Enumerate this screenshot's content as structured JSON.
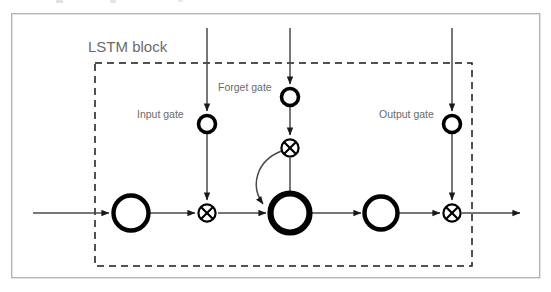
{
  "figure": {
    "kind": "diagram",
    "subject": "LSTM block",
    "background_color": "#ffffff",
    "frame": {
      "name": "outer-figure-border",
      "x": 11,
      "y": 13,
      "width": 529,
      "height": 265,
      "stroke_color": "#b5b5b5",
      "stroke_width": 1.4
    },
    "block_boundary": {
      "name": "lstm-block-dashed-boundary",
      "x": 95,
      "y": 63,
      "width": 377,
      "height": 203,
      "stroke_color": "#1a1a1a",
      "stroke_width": 1.5,
      "dash_pattern": "7 5"
    }
  },
  "labels": {
    "block_title": "LSTM block",
    "input_gate": "Input gate",
    "forget_gate": "Forget gate",
    "output_gate": "Output gate",
    "text_color": "#6b6b6b"
  },
  "nodes": [
    {
      "id": "input-squash-node",
      "name": "input-squashing-circle",
      "role": "input squashing function g",
      "shape": "circle-open",
      "cx": 131,
      "cy": 213,
      "r": 18,
      "stroke_width": 4.2,
      "stroke_color": "#000000"
    },
    {
      "id": "input-gate-node",
      "name": "input-gate-circle",
      "role": "input gate unit",
      "shape": "circle-open",
      "cx": 207,
      "cy": 124,
      "r": 9,
      "stroke_width": 3.4,
      "stroke_color": "#000000"
    },
    {
      "id": "input-multiply-node",
      "name": "input-multiply-operator",
      "role": "multiplicative input gating",
      "shape": "circle-cross",
      "cx": 207,
      "cy": 213,
      "r": 9,
      "stroke_width": 2.2,
      "stroke_color": "#000000"
    },
    {
      "id": "forget-gate-node",
      "name": "forget-gate-circle",
      "role": "forget gate unit",
      "shape": "circle-open",
      "cx": 290,
      "cy": 97,
      "r": 9,
      "stroke_width": 3.4,
      "stroke_color": "#000000"
    },
    {
      "id": "forget-multiply-node",
      "name": "forget-multiply-operator",
      "role": "multiplicative forget gating on recurrent self-connection",
      "shape": "circle-cross",
      "cx": 290,
      "cy": 148,
      "r": 9,
      "stroke_width": 2.2,
      "stroke_color": "#000000"
    },
    {
      "id": "cell-state-node",
      "name": "memory-cell-circle",
      "role": "constant error carousel / memory cell state",
      "shape": "circle-open",
      "cx": 290,
      "cy": 213,
      "r": 20,
      "stroke_width": 6,
      "stroke_color": "#000000"
    },
    {
      "id": "output-squash-node",
      "name": "output-squashing-circle",
      "role": "output squashing function h",
      "shape": "circle-open",
      "cx": 381,
      "cy": 213,
      "r": 17,
      "stroke_width": 4.2,
      "stroke_color": "#000000"
    },
    {
      "id": "output-gate-node",
      "name": "output-gate-circle",
      "role": "output gate unit",
      "shape": "circle-open",
      "cx": 452,
      "cy": 124,
      "r": 9,
      "stroke_width": 3.4,
      "stroke_color": "#000000"
    },
    {
      "id": "output-multiply-node",
      "name": "output-multiply-operator",
      "role": "multiplicative output gating",
      "shape": "circle-cross",
      "cx": 452,
      "cy": 213,
      "r": 9,
      "stroke_width": 2.2,
      "stroke_color": "#000000"
    }
  ],
  "connections": [
    {
      "id": "net-input-arrow",
      "name": "net-input-flow-arrow",
      "description": "net input entering the input squashing unit",
      "kind": "horizontal-arrow",
      "from_x": 33,
      "to_x": 110,
      "y": 213,
      "arrowhead": true
    },
    {
      "id": "squash-to-multiply",
      "name": "squash-to-input-multiply-arrow",
      "description": "squashed input toward multiplicative input gate",
      "kind": "horizontal-arrow",
      "from_x": 151,
      "to_x": 196,
      "y": 213,
      "arrowhead": true
    },
    {
      "id": "multiply-to-cell",
      "name": "input-multiply-to-cell-arrow",
      "description": "gated input entering the memory cell",
      "kind": "horizontal-arrow",
      "from_x": 218,
      "to_x": 267,
      "y": 213,
      "arrowhead": true
    },
    {
      "id": "cell-to-output-squash",
      "name": "cell-to-output-squash-arrow",
      "description": "cell state toward output squashing function",
      "kind": "horizontal-arrow",
      "from_x": 311,
      "to_x": 362,
      "y": 213,
      "arrowhead": true
    },
    {
      "id": "output-squash-to-multiply",
      "name": "output-squash-to-output-multiply-arrow",
      "description": "squashed cell output toward multiplicative output gate",
      "kind": "horizontal-arrow",
      "from_x": 399,
      "to_x": 441,
      "y": 213,
      "arrowhead": true
    },
    {
      "id": "block-output-arrow",
      "name": "block-output-flow-arrow",
      "description": "block output leaving the LSTM block",
      "kind": "horizontal-arrow",
      "from_x": 462,
      "to_x": 521,
      "y": 213,
      "arrowhead": true
    },
    {
      "id": "input-gate-incoming",
      "name": "input-gate-incoming-arrow",
      "description": "external activation entering the input gate unit",
      "kind": "vertical-arrow",
      "x": 207,
      "from_y": 28,
      "to_y": 113,
      "arrowhead": true
    },
    {
      "id": "input-gate-to-multiply",
      "name": "input-gate-to-multiply-arrow",
      "description": "input gate activation controlling the input multiplier",
      "kind": "vertical-arrow",
      "x": 207,
      "from_y": 133,
      "to_y": 202,
      "arrowhead": true
    },
    {
      "id": "forget-gate-incoming",
      "name": "forget-gate-incoming-arrow",
      "description": "external activation entering the forget gate unit",
      "kind": "vertical-arrow",
      "x": 290,
      "from_y": 28,
      "to_y": 86,
      "arrowhead": true
    },
    {
      "id": "forget-gate-to-multiply",
      "name": "forget-gate-to-multiply-arrow",
      "description": "forget gate activation controlling the recurrent multiplier",
      "kind": "vertical-arrow",
      "x": 290,
      "from_y": 106,
      "to_y": 137,
      "arrowhead": true
    },
    {
      "id": "forget-multiply-to-cell",
      "name": "forget-multiply-to-cell-arrow",
      "description": "gated recurrent self-connection feeding back into the cell",
      "kind": "vertical-arrow",
      "x": 290,
      "from_y": 159,
      "to_y": 192,
      "arrowhead": false
    },
    {
      "id": "output-gate-incoming",
      "name": "output-gate-incoming-arrow",
      "description": "external activation entering the output gate unit",
      "kind": "vertical-arrow",
      "x": 452,
      "from_y": 28,
      "to_y": 113,
      "arrowhead": true
    },
    {
      "id": "output-gate-to-multiply",
      "name": "output-gate-to-multiply-arrow",
      "description": "output gate activation controlling the output multiplier",
      "kind": "vertical-arrow",
      "x": 452,
      "from_y": 133,
      "to_y": 202,
      "arrowhead": true
    },
    {
      "id": "recurrent-feedback-curve",
      "name": "recurrent-self-connection-curve",
      "description": "curved self-recurrent connection from the forget multiplier back around into the memory cell",
      "kind": "curved-arrow",
      "path": "M 281 150 C 256 160 252 185 264 205",
      "arrowhead": true
    }
  ],
  "label_positions": {
    "block_title": {
      "x": 88,
      "y": 52
    },
    "input_gate": {
      "x": 137,
      "y": 118
    },
    "forget_gate": {
      "x": 218,
      "y": 91
    },
    "output_gate": {
      "x": 379,
      "y": 118
    }
  },
  "colors": {
    "stroke": "#000000",
    "line": "#4a4a4a",
    "frame": "#b5b5b5",
    "text": "#6b6b6b",
    "background": "#ffffff"
  }
}
